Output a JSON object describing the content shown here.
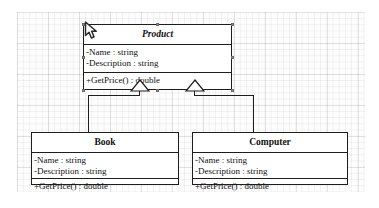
{
  "diagram": {
    "type": "uml-class-diagram",
    "relationship": "generalization",
    "classes": [
      {
        "id": "product",
        "name": "Product",
        "abstract": true,
        "attributes": [
          "-Name : string",
          "-Description : string"
        ],
        "operations": [
          "+GetPrice() : double"
        ]
      },
      {
        "id": "book",
        "name": "Book",
        "abstract": false,
        "attributes": [
          "-Name : string",
          "-Description : string"
        ],
        "operations": [
          "+GetPrice() : double"
        ]
      },
      {
        "id": "computer",
        "name": "Computer",
        "abstract": false,
        "attributes": [
          "-Name : string",
          "-Description : string"
        ],
        "operations": [
          "+GetPrice() : double"
        ]
      }
    ],
    "generalizations": [
      {
        "from": "book",
        "to": "product"
      },
      {
        "from": "computer",
        "to": "product"
      }
    ]
  },
  "canvas": {
    "cursor_icon": "arrow-cursor",
    "grid_visible": true,
    "selected_shape": "product"
  },
  "colors": {
    "line": "#1d1d1d",
    "fill": "#ffffff",
    "grid": "#c8c8cf",
    "handle": "#8a8a8a"
  }
}
